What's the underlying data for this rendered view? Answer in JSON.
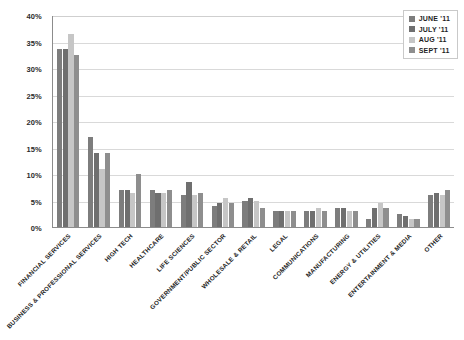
{
  "chart_data": {
    "type": "bar",
    "title": "",
    "subtitle": "",
    "xlabel": "",
    "ylabel": "",
    "ylim": [
      0,
      40
    ],
    "ytick_step": 5,
    "ytick_labels": [
      "40%",
      "35%",
      "30%",
      "25%",
      "20%",
      "15%",
      "10%",
      "5%",
      "0%"
    ],
    "ytick_values": [
      40,
      35,
      30,
      25,
      20,
      15,
      10,
      5,
      0
    ],
    "grid": true,
    "legend_position": "top-right",
    "categories": [
      "FINANCIAL SERVICES",
      "BUSINESS & PROFESSIONAL SERVICES",
      "HIGH TECH",
      "HEALTHCARE",
      "LIFE SCIENCES",
      "GOVERNMENT/PUBLIC SECTOR",
      "WHOLESALE & RETAIL",
      "LEGAL",
      "COMMUNICATIONS",
      "MANUFACTURING",
      "ENERGY & UTILITIES",
      "ENTERTAINMENT & MEDIA",
      "OTHER"
    ],
    "series": [
      {
        "name": "JUNE '11",
        "color": "#7d7d7d",
        "values": [
          33.5,
          17.0,
          7.0,
          7.0,
          6.0,
          4.0,
          5.0,
          3.0,
          3.0,
          3.5,
          1.5,
          2.5,
          6.0
        ]
      },
      {
        "name": "JULY '11",
        "color": "#6f6f6f",
        "values": [
          33.5,
          14.0,
          7.0,
          6.5,
          8.5,
          4.5,
          5.5,
          3.0,
          3.0,
          3.5,
          3.5,
          2.0,
          6.5
        ]
      },
      {
        "name": "AUG '11",
        "color": "#c6c6c6",
        "values": [
          36.5,
          11.0,
          6.5,
          6.5,
          6.0,
          5.5,
          5.0,
          3.0,
          3.5,
          3.0,
          4.5,
          1.5,
          6.0
        ]
      },
      {
        "name": "SEPT '11",
        "color": "#8e8e8e",
        "values": [
          32.5,
          14.0,
          10.0,
          7.0,
          6.5,
          4.5,
          3.5,
          3.0,
          3.0,
          3.0,
          3.5,
          1.5,
          7.0
        ]
      }
    ]
  },
  "legend": {
    "items": [
      {
        "label": "JUNE '11",
        "color": "#7d7d7d"
      },
      {
        "label": "JULY '11",
        "color": "#6f6f6f"
      },
      {
        "label": "AUG '11",
        "color": "#c6c6c6"
      },
      {
        "label": "SEPT '11",
        "color": "#8e8e8e"
      }
    ]
  }
}
